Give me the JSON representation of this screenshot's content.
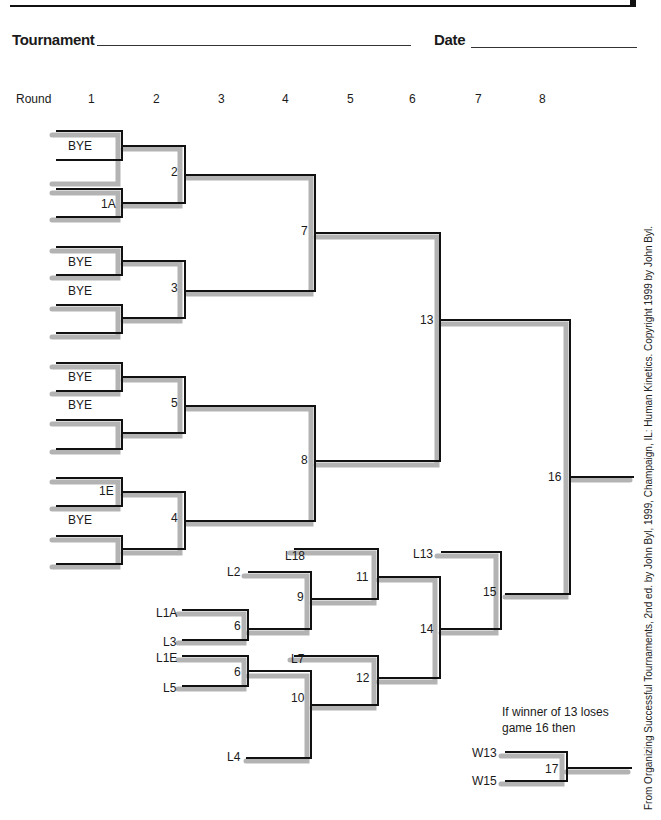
{
  "header": {
    "tournament_label": "Tournament",
    "date_label": "Date"
  },
  "rounds": {
    "label": "Round",
    "numbers": [
      "1",
      "2",
      "3",
      "4",
      "5",
      "6",
      "7",
      "8"
    ]
  },
  "winners_bracket": {
    "round1_slots": [
      "BYE",
      "",
      "",
      "1A",
      "BYE",
      "BYE",
      "",
      "",
      "BYE",
      "BYE",
      "",
      "",
      "1E",
      "",
      "BYE",
      ""
    ],
    "games": [
      "2",
      "3",
      "5",
      "4",
      "7",
      "8",
      "13"
    ]
  },
  "losers_bracket": {
    "entries": [
      "L2",
      "L1A",
      "L3",
      "L1E",
      "L5",
      "L4",
      "L18",
      "L7",
      "L13"
    ],
    "games": [
      "6",
      "6",
      "9",
      "10",
      "11",
      "12",
      "14",
      "15"
    ]
  },
  "final": {
    "game": "16"
  },
  "if_needed": {
    "note_line1": "If winner of 13 loses",
    "note_line2": "game 16 then",
    "entries": [
      "W13",
      "W15"
    ],
    "game": "17"
  },
  "credit": "From Organizing Successful Tournaments, 2nd ed. by John Byl, 1999, Champaign, IL: Human Kinetics. Copyright 1999 by John Byl.",
  "colors": {
    "line": "#111111",
    "shadow": "#b3b3b3"
  }
}
